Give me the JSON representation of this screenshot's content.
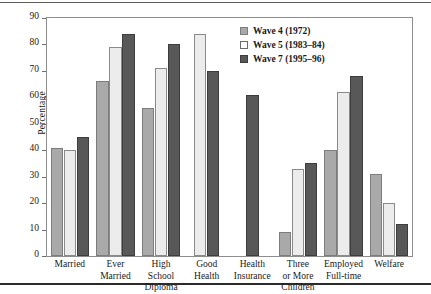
{
  "chart_data": {
    "type": "bar",
    "title": "",
    "xlabel": "",
    "ylabel": "Percentage",
    "ylim": [
      0,
      90
    ],
    "ytick_step": 10,
    "yticks": [
      0,
      10,
      20,
      30,
      40,
      50,
      60,
      70,
      80,
      90
    ],
    "grid": false,
    "legend_position": "top-right",
    "categories": [
      "Married",
      "Ever Married",
      "High School Diploma",
      "Good Health",
      "Health Insurance",
      "Three or More Children",
      "Employed Full-time",
      "Welfare"
    ],
    "category_lines": [
      [
        "Married"
      ],
      [
        "Ever",
        "Married"
      ],
      [
        "High",
        "School",
        "Diploma"
      ],
      [
        "Good",
        "Health"
      ],
      [
        "Health",
        "Insurance"
      ],
      [
        "Three",
        "or More",
        "Children"
      ],
      [
        "Employed",
        "Full-time"
      ],
      [
        "Welfare"
      ]
    ],
    "series": [
      {
        "name": "Wave 4 (1972)",
        "key": "w4",
        "color": "#a9a9a9",
        "values": [
          41,
          66,
          56,
          null,
          null,
          9,
          40,
          31
        ]
      },
      {
        "name": "Wave 5 (1983-84)",
        "key": "w5",
        "color": "#ececec",
        "values": [
          40,
          79,
          71,
          84,
          null,
          33,
          62,
          20
        ]
      },
      {
        "name": "Wave 7 (1995-96)",
        "key": "w7",
        "color": "#585858",
        "values": [
          45,
          84,
          80,
          70,
          61,
          35,
          68,
          12
        ]
      }
    ]
  },
  "legend": {
    "items": [
      {
        "label": "Wave 4 (1972)",
        "key": "w4"
      },
      {
        "label": "Wave 5 (1983–84)",
        "key": "w5"
      },
      {
        "label": "Wave 7 (1995–96)",
        "key": "w7"
      }
    ]
  },
  "axis": {
    "y_label": "Percentage"
  }
}
